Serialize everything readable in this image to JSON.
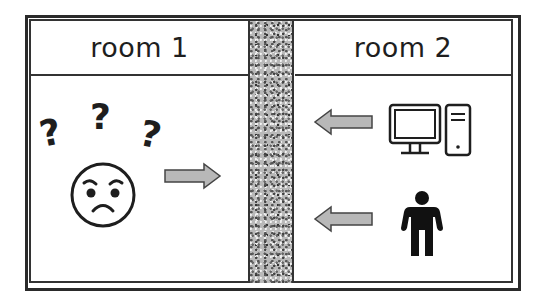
{
  "diagram": {
    "rooms": [
      {
        "label": "room 1",
        "contents": [
          "question-marks",
          "frowning-face",
          "arrow-right"
        ]
      },
      {
        "label": "room 2",
        "contents": [
          "computer",
          "person",
          "arrow-left",
          "arrow-left"
        ]
      }
    ],
    "wall": {
      "label": ""
    },
    "question_marks": [
      "?",
      "?",
      "?"
    ],
    "colors": {
      "arrow_fill": "#b8b8b8",
      "stroke": "#1e1e1e",
      "wall": "#b9b9b9"
    }
  }
}
